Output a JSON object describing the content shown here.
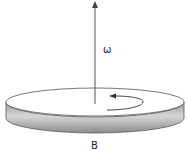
{
  "diagram": {
    "labels": {
      "angular_velocity": "ω",
      "disk": "B"
    },
    "colors": {
      "line": "#555555",
      "disk_top": "#ffffff",
      "disk_side_light": "#d4d4d4",
      "disk_side_dark": "#8a8a8a"
    },
    "elements": [
      {
        "type": "vector",
        "name": "omega",
        "direction": "up"
      },
      {
        "type": "curved-arrow",
        "name": "rotation",
        "direction": "counterclockwise"
      },
      {
        "type": "disk",
        "name": "B"
      }
    ]
  }
}
